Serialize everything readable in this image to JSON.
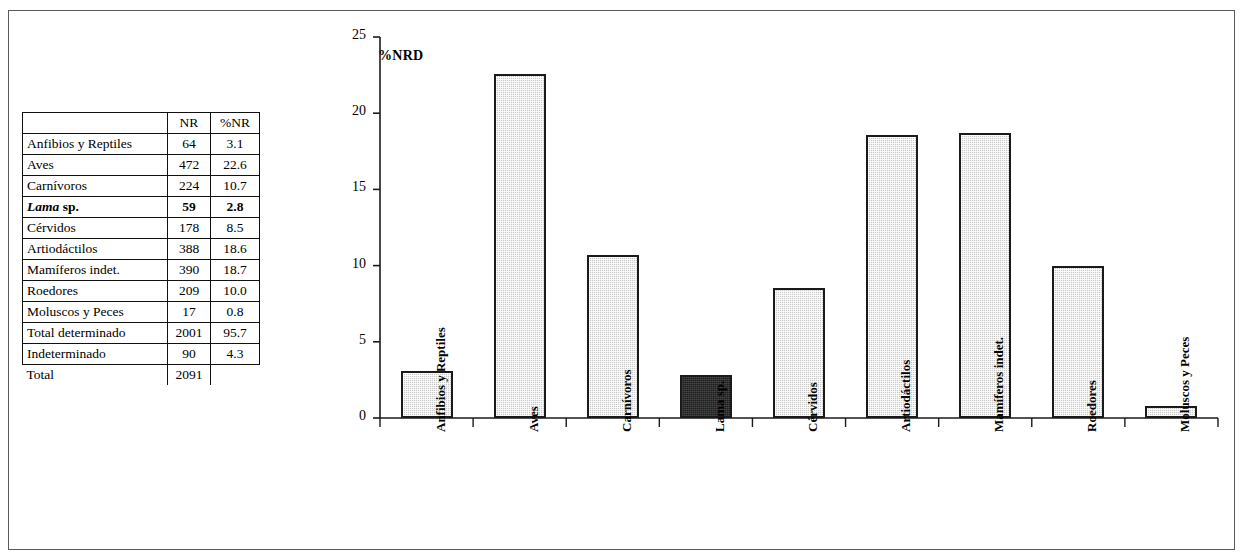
{
  "table": {
    "headers": [
      "",
      "NR",
      "%NR"
    ],
    "rows": [
      {
        "label": "Anfibios y Reptiles",
        "nr": "64",
        "pnr": "3.1",
        "bold": false
      },
      {
        "label": "Aves",
        "nr": "472",
        "pnr": "22.6",
        "bold": false
      },
      {
        "label": "Carnívoros",
        "nr": "224",
        "pnr": "10.7",
        "bold": false
      },
      {
        "label": "Lama sp.",
        "label_italic": "Lama",
        "label_rest": "sp.",
        "nr": "59",
        "pnr": "2.8",
        "bold": true
      },
      {
        "label": "Cérvidos",
        "nr": "178",
        "pnr": "8.5",
        "bold": false
      },
      {
        "label": "Artiodáctilos",
        "nr": "388",
        "pnr": "18.6",
        "bold": false
      },
      {
        "label": "Mamíferos indet.",
        "nr": "390",
        "pnr": "18.7",
        "bold": false
      },
      {
        "label": "Roedores",
        "nr": "209",
        "pnr": "10.0",
        "bold": false
      },
      {
        "label": "Moluscos y Peces",
        "nr": "17",
        "pnr": "0.8",
        "bold": false
      },
      {
        "label": "Total determinado",
        "nr": "2001",
        "pnr": "95.7",
        "bold": false
      },
      {
        "label": "Indeterminado",
        "nr": "90",
        "pnr": "4.3",
        "bold": false
      }
    ],
    "footer": {
      "label": "Total",
      "nr": "2091",
      "pnr": ""
    }
  },
  "chart_data": {
    "type": "bar",
    "title": "",
    "ylabel": "%NRD",
    "xlabel": "",
    "ylim": [
      0,
      25
    ],
    "yticks": [
      "0",
      "5",
      "10",
      "15",
      "20",
      "25"
    ],
    "grid": false,
    "legend": "none",
    "categories": [
      "Anfibios y Reptiles",
      "Aves",
      "Carnívoros",
      "Lama sp.",
      "Cérvidos",
      "Artiodáctilos",
      "Mamíferos indet.",
      "Roedores",
      "Moluscos y Peces"
    ],
    "values": [
      3.1,
      22.6,
      10.7,
      2.8,
      8.5,
      18.6,
      18.7,
      10.0,
      0.8
    ],
    "bar_styles": [
      "light",
      "light",
      "light",
      "dark",
      "light",
      "light",
      "light",
      "light",
      "light"
    ],
    "colors": {
      "light_fill": "#c8c8c8",
      "dark_fill": "#1e1e1e",
      "outline": "#1a1a1a",
      "axis": "#1a1a1a"
    }
  }
}
